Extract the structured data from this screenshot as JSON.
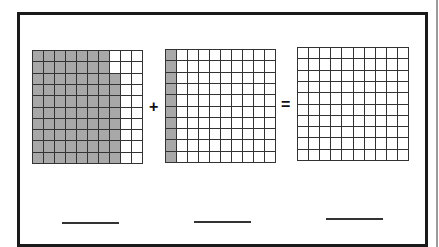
{
  "diagram": {
    "type": "hundredths-grid-addition",
    "grids": [
      {
        "name": "addend-1",
        "rows": 10,
        "cols": 10,
        "shaded_per_row": [
          7,
          7,
          8,
          8,
          8,
          8,
          8,
          8,
          8,
          8
        ],
        "shaded_total": 78
      },
      {
        "name": "addend-2",
        "rows": 10,
        "cols": 10,
        "shaded_per_row": [
          1,
          1,
          1,
          1,
          1,
          1,
          1,
          1,
          1,
          1
        ],
        "shaded_total": 10
      },
      {
        "name": "sum",
        "rows": 10,
        "cols": 10,
        "shaded_per_row": [
          0,
          0,
          0,
          0,
          0,
          0,
          0,
          0,
          0,
          0
        ],
        "shaded_total": 0
      }
    ],
    "operators": {
      "plus": "+",
      "equals": "="
    },
    "answer_blanks": [
      "",
      "",
      ""
    ],
    "colors": {
      "shaded": "#a8a8a8",
      "unshaded": "#ffffff",
      "gridline": "#333333",
      "frame": "#1a1a1a"
    }
  }
}
